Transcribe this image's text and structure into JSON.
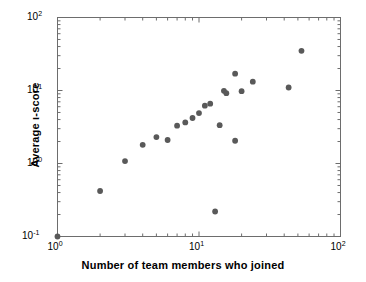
{
  "chart_data": {
    "type": "scatter",
    "title": "",
    "xlabel": "Number of team members who joined",
    "ylabel": "Average ι-score",
    "xscale": "log",
    "yscale": "log",
    "xlim": [
      1,
      100
    ],
    "ylim": [
      0.1,
      100
    ],
    "grid": false,
    "legend": null,
    "marker": {
      "shape": "circle",
      "color": "#595959",
      "size_px": 5
    },
    "xticks": [
      {
        "value": 1,
        "label": "10",
        "exponent": "0"
      },
      {
        "value": 10,
        "label": "10",
        "exponent": "1"
      },
      {
        "value": 100,
        "label": "10",
        "exponent": "2"
      }
    ],
    "yticks": [
      {
        "value": 0.1,
        "label": "10",
        "exponent": "-1"
      },
      {
        "value": 1,
        "label": "10",
        "exponent": "0"
      },
      {
        "value": 10,
        "label": "10",
        "exponent": "1"
      },
      {
        "value": 100,
        "label": "10",
        "exponent": "2"
      }
    ],
    "points": [
      {
        "x": 1,
        "y": 0.1
      },
      {
        "x": 2,
        "y": 0.42
      },
      {
        "x": 3,
        "y": 1.08
      },
      {
        "x": 4,
        "y": 1.8
      },
      {
        "x": 5,
        "y": 2.3
      },
      {
        "x": 6,
        "y": 2.1
      },
      {
        "x": 7,
        "y": 3.3
      },
      {
        "x": 8,
        "y": 3.65
      },
      {
        "x": 9,
        "y": 4.2
      },
      {
        "x": 10,
        "y": 4.9
      },
      {
        "x": 11,
        "y": 6.2
      },
      {
        "x": 12,
        "y": 6.6
      },
      {
        "x": 13,
        "y": 0.22
      },
      {
        "x": 14,
        "y": 3.35
      },
      {
        "x": 15,
        "y": 9.9
      },
      {
        "x": 15.6,
        "y": 9.2
      },
      {
        "x": 18,
        "y": 17.0
      },
      {
        "x": 18,
        "y": 2.05
      },
      {
        "x": 20,
        "y": 9.8
      },
      {
        "x": 24,
        "y": 13.2
      },
      {
        "x": 43,
        "y": 11.0
      },
      {
        "x": 53,
        "y": 35.0
      }
    ]
  }
}
